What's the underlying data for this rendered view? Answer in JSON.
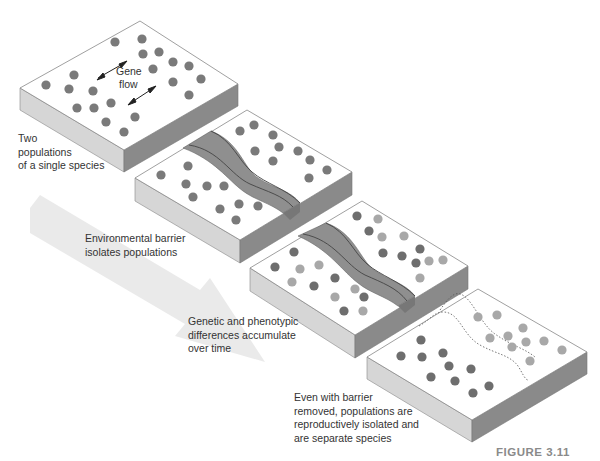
{
  "diagram": {
    "figure_label": "FIGURE 3.11",
    "gene_flow_label_line1": "Gene",
    "gene_flow_label_line2": "flow",
    "captions": [
      {
        "line1": "Two",
        "line2": "populations",
        "line3": "of a single species"
      },
      {
        "line1": "Environmental barrier",
        "line2": "isolates populations"
      },
      {
        "line1": "Genetic and phenotypic",
        "line2": "differences accumulate",
        "line3": "over time"
      },
      {
        "line1": "Even with barrier",
        "line2": "removed, populations are",
        "line3": "reproductively isolated and",
        "line4": "are separate species"
      }
    ],
    "stages": [
      {
        "name": "single-population",
        "barrier": "none"
      },
      {
        "name": "barrier-forms",
        "barrier": "river"
      },
      {
        "name": "divergence",
        "barrier": "river"
      },
      {
        "name": "barrier-removed",
        "barrier": "dotted-outline"
      }
    ],
    "colors": {
      "slab_top": "#ffffff",
      "slab_left": "#d9d9d9",
      "slab_right": "#8c8c8c",
      "dot_original": "#7a7a7a",
      "dot_dark": "#6e6e6e",
      "dot_light": "#a8a8a8",
      "river": "#8f8f8f",
      "arrow": "#e6e6e6"
    }
  }
}
